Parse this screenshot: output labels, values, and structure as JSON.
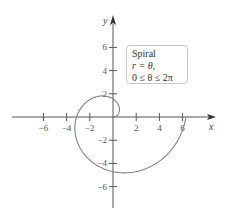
{
  "chart_data": {
    "type": "line",
    "title": "",
    "xlabel": "x",
    "ylabel": "y",
    "xlim": [
      -8.5,
      8.8
    ],
    "ylim": [
      -8,
      8.5
    ],
    "x_ticks": [
      -6,
      -4,
      -2,
      2,
      4,
      6
    ],
    "y_ticks": [
      6,
      4,
      2,
      -2,
      -4,
      -6
    ],
    "grid": false,
    "legend_position": "upper-right",
    "annotation": {
      "line1": "Spiral",
      "line2": "r = θ,",
      "line3": "0 ≤ θ ≤ 2π"
    },
    "series": [
      {
        "name": "Spiral r = θ",
        "equation": "r = θ",
        "param_range": [
          0,
          6.2832
        ],
        "polar": true,
        "sample_points": [
          {
            "theta": 0,
            "x": 0,
            "y": 0
          },
          {
            "theta": 1.5708,
            "x": 0,
            "y": 1.57
          },
          {
            "theta": 3.1416,
            "x": -3.14,
            "y": 0
          },
          {
            "theta": 4.7124,
            "x": 0,
            "y": -4.71
          },
          {
            "theta": 6.2832,
            "x": 6.28,
            "y": 0
          }
        ]
      }
    ],
    "colors": {
      "curve": "#808080",
      "axes": "#555555",
      "legend_border": "#c8c8c8"
    }
  }
}
